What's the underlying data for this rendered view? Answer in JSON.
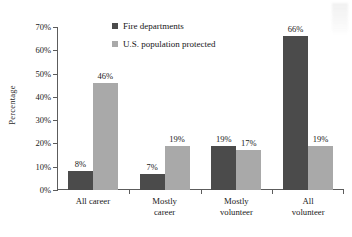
{
  "chart_data": {
    "type": "bar",
    "title": "",
    "subtitle": "",
    "xlabel": "",
    "ylabel": "Percentage",
    "ylim": [
      0,
      70
    ],
    "ytick_step": 10,
    "ytick_labels": [
      "0%",
      "10%",
      "20%",
      "30%",
      "40%",
      "50%",
      "60%",
      "70%"
    ],
    "grid": false,
    "legend_position": "top-center",
    "categories": [
      "All career",
      "Mostly career",
      "Mostly\nvolunteer",
      "All volunteer"
    ],
    "series": [
      {
        "name": "Fire departments",
        "color": "#4b4b4b",
        "values": [
          8,
          7,
          19,
          66
        ],
        "labels": [
          "8%",
          "7%",
          "19%",
          "66%"
        ]
      },
      {
        "name": "U.S. population protected",
        "color": "#a9a9a9",
        "values": [
          46,
          19,
          17,
          19
        ],
        "labels": [
          "46%",
          "19%",
          "17%",
          "19%"
        ]
      }
    ]
  }
}
